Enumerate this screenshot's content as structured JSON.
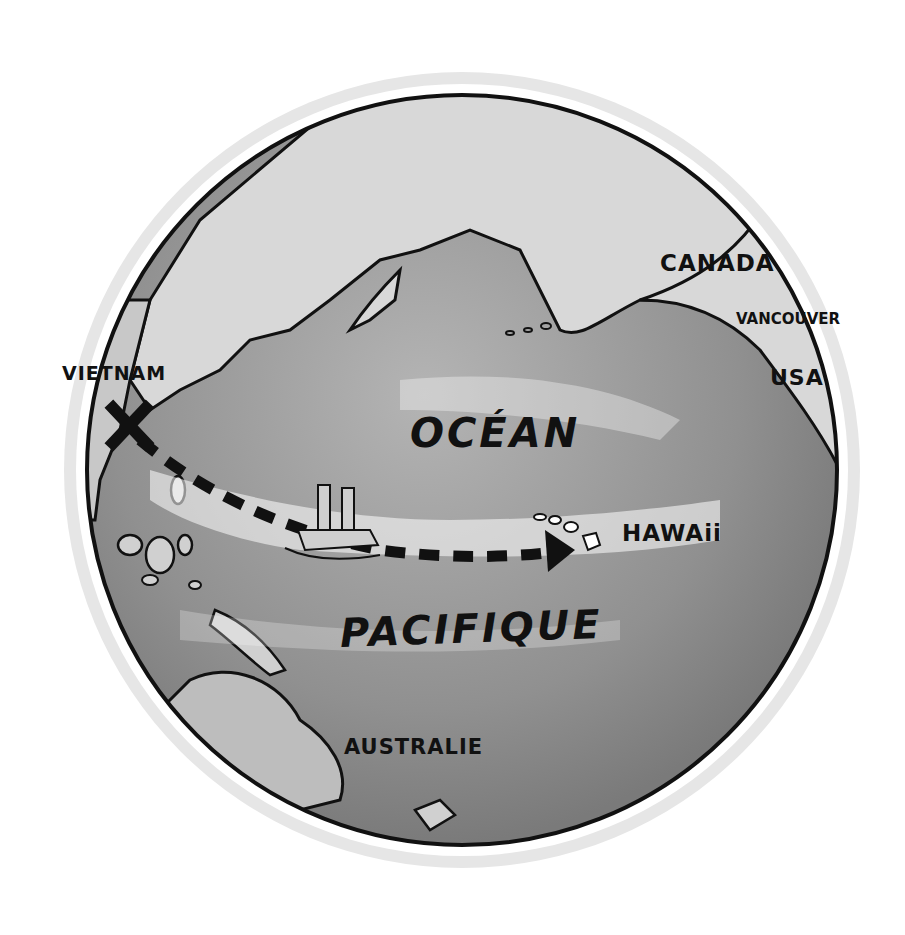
{
  "map": {
    "style": "hand-drawn globe, grayscale",
    "labels": {
      "vietnam": "VIETNAM",
      "canada": "CANADA",
      "vancouver": "VANCOUVER",
      "usa": "USA",
      "ocean_line1": "OCÉAN",
      "ocean_line2": "PACIFIQUE",
      "hawaii": "HAWAii",
      "australia": "AUSTRALIE"
    },
    "route": {
      "from": "VIETNAM",
      "to": "HAWAii",
      "start_marker": "x-mark",
      "line_style": "dashed",
      "end_marker": "arrowhead"
    },
    "colors": {
      "ocean": "#8f8f8f",
      "land": "#d9d9d9",
      "outline": "#111111",
      "highlight": "#ffffff"
    }
  }
}
